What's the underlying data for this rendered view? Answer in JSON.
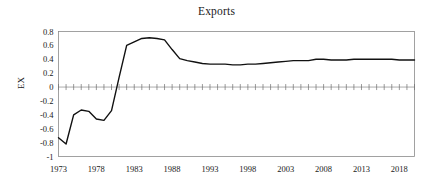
{
  "chart_data": {
    "type": "line",
    "title": "Exports",
    "xlabel": "",
    "ylabel": "EX",
    "grid": false,
    "legend": null,
    "legend_position": "none",
    "xlim": [
      1973,
      2020
    ],
    "ylim": [
      -1,
      0.8
    ],
    "y_ticks": [
      "0.8",
      "0.6",
      "0.4",
      "0.2",
      "0",
      "-0.2",
      "-0.4",
      "-0.6",
      "-0.8",
      "-1"
    ],
    "y_tick_values": [
      0.8,
      0.6,
      0.4,
      0.2,
      0,
      -0.2,
      -0.4,
      -0.6,
      -0.8,
      -1
    ],
    "x_ticks": [
      "1973",
      "1978",
      "1983",
      "1988",
      "1993",
      "1998",
      "2003",
      "2008",
      "2013",
      "2018"
    ],
    "x_tick_values": [
      1973,
      1978,
      1983,
      1988,
      1993,
      1998,
      2003,
      2008,
      2013,
      2018
    ],
    "zero_reference_line": 0,
    "series": [
      {
        "name": "EX",
        "color": "#111111",
        "x": [
          1973,
          1974,
          1975,
          1976,
          1977,
          1978,
          1979,
          1980,
          1981,
          1982,
          1983,
          1984,
          1985,
          1986,
          1987,
          1988,
          1989,
          1990,
          1991,
          1992,
          1993,
          1994,
          1995,
          1996,
          1997,
          1998,
          1999,
          2000,
          2001,
          2002,
          2003,
          2004,
          2005,
          2006,
          2007,
          2008,
          2009,
          2010,
          2011,
          2012,
          2013,
          2014,
          2015,
          2016,
          2017,
          2018,
          2019,
          2020
        ],
        "values": [
          -0.73,
          -0.82,
          -0.4,
          -0.33,
          -0.35,
          -0.46,
          -0.48,
          -0.34,
          0.14,
          0.6,
          0.65,
          0.7,
          0.71,
          0.7,
          0.68,
          0.54,
          0.41,
          0.38,
          0.36,
          0.34,
          0.33,
          0.33,
          0.33,
          0.32,
          0.32,
          0.33,
          0.33,
          0.34,
          0.35,
          0.36,
          0.37,
          0.38,
          0.38,
          0.38,
          0.4,
          0.4,
          0.39,
          0.39,
          0.39,
          0.4,
          0.4,
          0.4,
          0.4,
          0.4,
          0.4,
          0.39,
          0.39,
          0.39
        ]
      }
    ]
  }
}
